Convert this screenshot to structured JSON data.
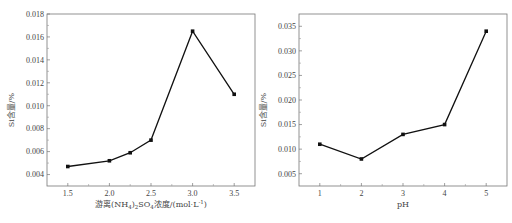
{
  "chart_data": [
    {
      "type": "line",
      "title": "",
      "xlabel": "游离(NH4)2SO4浓度/(mol·L-1)",
      "xlabel_parts": {
        "pre": "游离(NH",
        "sub1": "4",
        "mid1": ")",
        "sub2": "2",
        "mid2": "SO",
        "sub3": "4",
        "post": "浓度/(mol·L",
        "sup": "-1",
        "end": ")"
      },
      "ylabel": "Si含量/%",
      "x": [
        1.5,
        2.0,
        2.25,
        2.5,
        3.0,
        3.5
      ],
      "values": [
        0.0047,
        0.0052,
        0.0059,
        0.007,
        0.0165,
        0.011
      ],
      "xlim": [
        1.25,
        3.75
      ],
      "ylim": [
        0.003,
        0.018
      ],
      "xticks": [
        "1.5",
        "2.0",
        "2.5",
        "3.0",
        "3.5"
      ],
      "xtick_values": [
        1.5,
        2.0,
        2.5,
        3.0,
        3.5
      ],
      "yticks": [
        "0.004",
        "0.006",
        "0.008",
        "0.010",
        "0.012",
        "0.014",
        "0.016",
        "0.018"
      ],
      "ytick_values": [
        0.004,
        0.006,
        0.008,
        0.01,
        0.012,
        0.014,
        0.016,
        0.018
      ],
      "grid": false,
      "marker": "square",
      "color": "#111111"
    },
    {
      "type": "line",
      "title": "",
      "xlabel": "pH",
      "ylabel": "Si含量/%",
      "x": [
        1,
        2,
        3,
        4,
        5
      ],
      "values": [
        0.011,
        0.008,
        0.013,
        0.015,
        0.034
      ],
      "xlim": [
        0.5,
        5.5
      ],
      "ylim": [
        0.0025,
        0.0375
      ],
      "xticks": [
        "1",
        "2",
        "3",
        "4",
        "5"
      ],
      "xtick_values": [
        1,
        2,
        3,
        4,
        5
      ],
      "yticks": [
        "0.005",
        "0.010",
        "0.015",
        "0.020",
        "0.025",
        "0.030",
        "0.035"
      ],
      "ytick_values": [
        0.005,
        0.01,
        0.015,
        0.02,
        0.025,
        0.03,
        0.035
      ],
      "grid": false,
      "marker": "square",
      "color": "#111111"
    }
  ]
}
